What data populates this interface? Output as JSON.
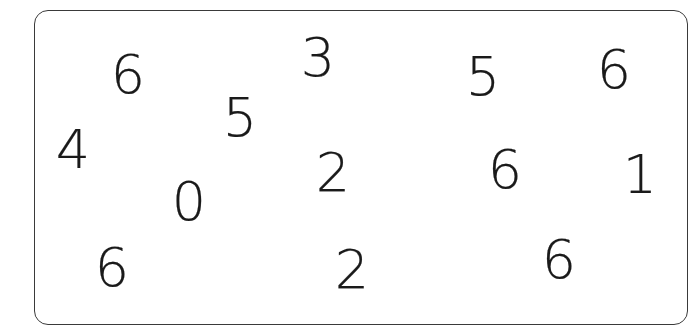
{
  "worksheet": {
    "digits": [
      {
        "value": "6",
        "x": 128,
        "y": 75
      },
      {
        "value": "3",
        "x": 318,
        "y": 58
      },
      {
        "value": "5",
        "x": 483,
        "y": 77
      },
      {
        "value": "6",
        "x": 614,
        "y": 70
      },
      {
        "value": "4",
        "x": 73,
        "y": 150
      },
      {
        "value": "5",
        "x": 240,
        "y": 118
      },
      {
        "value": "2",
        "x": 333,
        "y": 173
      },
      {
        "value": "6",
        "x": 505,
        "y": 170
      },
      {
        "value": "1",
        "x": 640,
        "y": 175
      },
      {
        "value": "0",
        "x": 189,
        "y": 202
      },
      {
        "value": "6",
        "x": 112,
        "y": 268
      },
      {
        "value": "2",
        "x": 352,
        "y": 270
      },
      {
        "value": "6",
        "x": 559,
        "y": 260
      }
    ]
  }
}
